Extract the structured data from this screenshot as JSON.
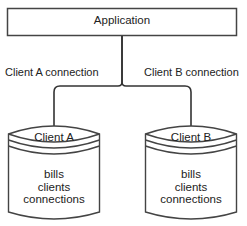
{
  "diagram": {
    "application": {
      "label": "Application"
    },
    "connections": [
      {
        "label": "Client A connection"
      },
      {
        "label": "Client B connection"
      }
    ],
    "databases": [
      {
        "title": "Client A",
        "tables": [
          "bills",
          "clients",
          "connections"
        ]
      },
      {
        "title": "Client B",
        "tables": [
          "bills",
          "clients",
          "connections"
        ]
      }
    ],
    "colors": {
      "stroke": "#333333",
      "text": "#222222",
      "background": "#ffffff"
    }
  }
}
